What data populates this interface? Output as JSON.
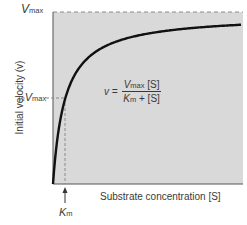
{
  "chart_data": {
    "type": "line",
    "title": "",
    "xlabel": "Substrate concentration [S]",
    "ylabel": "Initial velocity (v)",
    "equation": {
      "lhs": "v =",
      "numerator": "Vmax [S]",
      "denominator": "Km + [S]"
    },
    "annotations": [
      {
        "text": "Vmax",
        "at": "y = Vmax (dashed asymptote)"
      },
      {
        "text": "½ Vmax",
        "at": "y = 0.5 Vmax (dashed)"
      },
      {
        "text": "Km",
        "at": "x = Km (dashed, arrow)"
      }
    ],
    "series": [
      {
        "name": "Michaelis–Menten curve",
        "Vmax": 1.0,
        "Km": 1.0,
        "x": [
          0,
          0.25,
          0.5,
          1,
          2,
          3,
          5,
          8,
          12,
          16
        ],
        "y": [
          0,
          0.2,
          0.333,
          0.5,
          0.667,
          0.75,
          0.833,
          0.889,
          0.923,
          0.941
        ]
      }
    ],
    "xlim": [
      0,
      16
    ],
    "ylim": [
      0,
      1
    ],
    "grid": false,
    "legend": "none"
  },
  "labels": {
    "vmax_v": "V",
    "vmax_sub": "max",
    "half_frac": "½",
    "half_v": "V",
    "half_sub": "max",
    "km_k": "K",
    "km_sub": "m",
    "eq_lhs": "v =",
    "eq_num_v": "V",
    "eq_num_sub": "max",
    "eq_num_s": " [S]",
    "eq_den_k": "K",
    "eq_den_sub": "m",
    "eq_den_rest": " + [S]",
    "xlabel": "Substrate concentration [S]",
    "ylabel": "Initial velocity (v)"
  },
  "colors": {
    "plot_bg": "#d9d9d9",
    "curve": "#111111",
    "dashed": "#8a8a8a",
    "text": "#3a3a3a"
  }
}
